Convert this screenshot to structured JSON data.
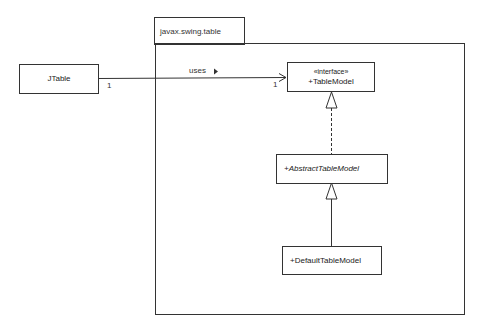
{
  "diagram": {
    "type": "UML class diagram",
    "package": {
      "name": "javax.swing.table"
    },
    "classes": [
      {
        "id": "jtable",
        "name": "JTable",
        "stereotype": null,
        "abstract": false,
        "in_package": false
      },
      {
        "id": "tablemodel",
        "name": "+TableModel",
        "stereotype": "«interface»",
        "abstract": false,
        "in_package": true
      },
      {
        "id": "abstracttablemodel",
        "name": "+AbstractTableModel",
        "stereotype": null,
        "abstract": true,
        "in_package": true
      },
      {
        "id": "defaulttablemodel",
        "name": "+DefaultTableModel",
        "stereotype": null,
        "abstract": false,
        "in_package": true
      }
    ],
    "relationships": [
      {
        "type": "association",
        "from": "JTable",
        "to": "TableModel",
        "label": "uses",
        "direction_marker": "▶",
        "from_multiplicity": "1",
        "to_multiplicity": "1",
        "navigable_to": true
      },
      {
        "type": "realization",
        "from": "AbstractTableModel",
        "to": "TableModel"
      },
      {
        "type": "generalization",
        "from": "DefaultTableModel",
        "to": "AbstractTableModel"
      }
    ]
  },
  "colors": {
    "line": "#333333",
    "background": "#ffffff",
    "text": "#222222"
  }
}
